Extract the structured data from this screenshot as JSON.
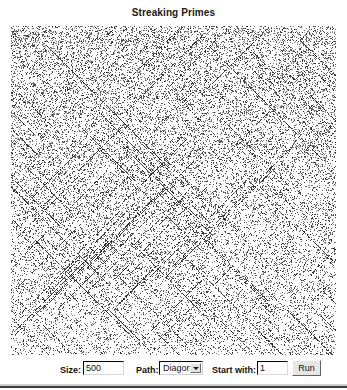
{
  "window": {
    "title": "Streaking Primes"
  },
  "plot": {
    "name": "prime-scatter-canvas",
    "description": "Prime number scatter plot with diagonal streaks",
    "dot_color": "#303030",
    "background_color": "#ffffff",
    "width": 325,
    "height": 329,
    "grid_size": 500,
    "path": "Diagonal",
    "start": 1
  },
  "toolbar": {
    "size_label": "Size:",
    "size_value": "500",
    "size_placeholder": "500",
    "path_label": "Path:",
    "path_value": "Diagonal",
    "path_options": [
      "Diagonal"
    ],
    "dropdown_icon": "chevron-down-icon",
    "start_label": "Start with:",
    "start_value": "1",
    "start_placeholder": "1",
    "run_label": "Run"
  }
}
